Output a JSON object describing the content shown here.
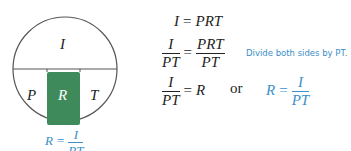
{
  "diagram": {
    "top_label": "I",
    "left_label": "P",
    "middle_label": "R",
    "right_label": "T",
    "caption": {
      "lhs": "R",
      "eq": "=",
      "num": "I",
      "den": "PT"
    },
    "colors": {
      "highlight": "#3f8a5a",
      "caption": "#3a8fc9",
      "stroke": "#555555"
    }
  },
  "equations": {
    "line1": {
      "lhs": "I",
      "eq": "=",
      "rhs": "PRT"
    },
    "line2": {
      "lhs_num": "I",
      "lhs_den": "PT",
      "eq": "=",
      "rhs_num": "PRT",
      "rhs_den": "PT"
    },
    "note": "Divide both sides by PT.",
    "line3": {
      "lhs_num": "I",
      "lhs_den": "PT",
      "eq": "=",
      "rhs": "R"
    },
    "or": "or",
    "alt": {
      "lhs": "R",
      "eq": "=",
      "num": "I",
      "den": "PT"
    }
  }
}
